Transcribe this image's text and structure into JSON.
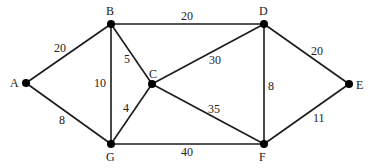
{
  "graph": {
    "nodes": [
      {
        "id": "A",
        "x": 26,
        "y": 83,
        "label": "A",
        "lx": 10,
        "ly": 87
      },
      {
        "id": "B",
        "x": 111,
        "y": 24,
        "label": "B",
        "lx": 106,
        "ly": 15
      },
      {
        "id": "C",
        "x": 152,
        "y": 84,
        "label": "C",
        "lx": 149,
        "ly": 78
      },
      {
        "id": "D",
        "x": 264,
        "y": 24,
        "label": "D",
        "lx": 259,
        "ly": 15
      },
      {
        "id": "E",
        "x": 349,
        "y": 84,
        "label": "E",
        "lx": 356,
        "ly": 89
      },
      {
        "id": "F",
        "x": 264,
        "y": 144,
        "label": "F",
        "lx": 259,
        "ly": 161
      },
      {
        "id": "G",
        "x": 111,
        "y": 144,
        "label": "G",
        "lx": 106,
        "ly": 161
      }
    ],
    "edges": [
      {
        "from": "A",
        "to": "B",
        "weight": "20",
        "lx": 54,
        "ly": 52
      },
      {
        "from": "A",
        "to": "G",
        "weight": "8",
        "lx": 59,
        "ly": 124
      },
      {
        "from": "B",
        "to": "G",
        "weight": "10",
        "lx": 94,
        "ly": 87
      },
      {
        "from": "B",
        "to": "C",
        "weight": "5",
        "lx": 124,
        "ly": 63
      },
      {
        "from": "C",
        "to": "G",
        "weight": "4",
        "lx": 123,
        "ly": 112
      },
      {
        "from": "B",
        "to": "D",
        "weight": "20",
        "lx": 181,
        "ly": 20
      },
      {
        "from": "C",
        "to": "D",
        "weight": "30",
        "lx": 209,
        "ly": 64
      },
      {
        "from": "C",
        "to": "F",
        "weight": "35",
        "lx": 208,
        "ly": 113
      },
      {
        "from": "G",
        "to": "F",
        "weight": "40",
        "lx": 181,
        "ly": 156
      },
      {
        "from": "D",
        "to": "F",
        "weight": "8",
        "lx": 268,
        "ly": 90
      },
      {
        "from": "D",
        "to": "E",
        "weight": "20",
        "lx": 311,
        "ly": 55
      },
      {
        "from": "F",
        "to": "E",
        "weight": "11",
        "lx": 313,
        "ly": 122
      }
    ]
  }
}
